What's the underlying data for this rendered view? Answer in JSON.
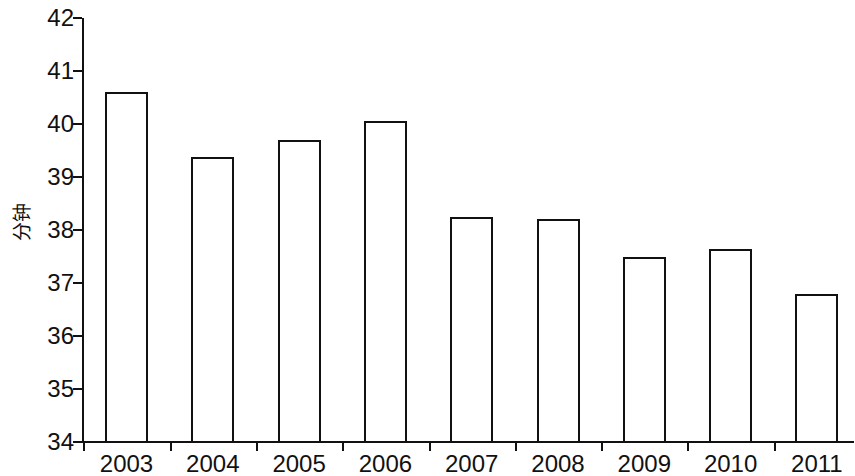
{
  "chart_data": {
    "type": "bar",
    "title": "",
    "subtitle": "",
    "xlabel": "",
    "ylabel": "分钟",
    "categories": [
      "2003",
      "2004",
      "2005",
      "2006",
      "2007",
      "2008",
      "2009",
      "2010",
      "2011"
    ],
    "values": [
      40.6,
      39.38,
      39.7,
      40.05,
      38.25,
      38.2,
      37.5,
      37.65,
      36.8
    ],
    "series": [
      {
        "name": "",
        "values": [
          40.6,
          39.38,
          39.7,
          40.05,
          38.25,
          38.2,
          37.5,
          37.65,
          36.8
        ]
      }
    ],
    "ylim": [
      34,
      42
    ],
    "ytick_labels": [
      "34",
      "35",
      "36",
      "37",
      "38",
      "39",
      "40",
      "41",
      "42"
    ],
    "ytick_values": [
      34,
      35,
      36,
      37,
      38,
      39,
      40,
      41,
      42
    ],
    "ytick_interval": 1,
    "grid": false,
    "legend": null,
    "legend_position": "none",
    "bar_fill_color": "#ffffff",
    "bar_edge_color": "#111111",
    "axis_color": "#111111",
    "background_color": "#ffffff",
    "annotations": []
  }
}
